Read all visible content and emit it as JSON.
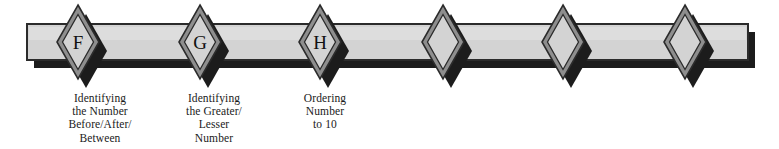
{
  "canvas": {
    "width": 779,
    "height": 149,
    "background": "#ffffff"
  },
  "colors": {
    "bar_fill": "#d3d3d3",
    "bar_fill_light": "#dcdcdc",
    "bar_outline": "#2b2b2b",
    "shadow": "#1c1c1c",
    "diamond_outer": "#8e8e8e",
    "diamond_inner": "#d3d3d3",
    "diamond_outline": "#2b2b2b",
    "text": "#1a1a1a"
  },
  "bar": {
    "name": "horizontal-progression-bar",
    "x": 27,
    "y": 24,
    "width": 721,
    "height": 36,
    "shadow_offset_x": 7,
    "shadow_offset_y": 8
  },
  "diamonds": [
    {
      "id": "diamond-f",
      "letter": "F",
      "cx": 78,
      "cy": 42,
      "rx": 21,
      "ry": 37
    },
    {
      "id": "diamond-g",
      "letter": "G",
      "cx": 200,
      "cy": 42,
      "rx": 21,
      "ry": 37
    },
    {
      "id": "diamond-h",
      "letter": "H",
      "cx": 320,
      "cy": 42,
      "rx": 21,
      "ry": 37
    },
    {
      "id": "diamond-4",
      "letter": "",
      "cx": 443,
      "cy": 42,
      "rx": 21,
      "ry": 37
    },
    {
      "id": "diamond-5",
      "letter": "",
      "cx": 563,
      "cy": 42,
      "rx": 21,
      "ry": 37
    },
    {
      "id": "diamond-6",
      "letter": "",
      "cx": 685,
      "cy": 42,
      "rx": 21,
      "ry": 37
    }
  ],
  "labels": [
    {
      "id": "label-f",
      "for": "diamond-f",
      "cx": 100,
      "top": 92,
      "width": 130,
      "text": "Identifying\nthe Number\nBefore/After/\nBetween",
      "lines": [
        "Identifying",
        "the Number",
        "Before/After/",
        "Between"
      ]
    },
    {
      "id": "label-g",
      "for": "diamond-g",
      "cx": 214,
      "top": 92,
      "width": 130,
      "text": "Identifying\nthe Greater/\nLesser\nNumber",
      "lines": [
        "Identifying",
        "the Greater/",
        "Lesser",
        "Number"
      ]
    },
    {
      "id": "label-h",
      "for": "diamond-h",
      "cx": 325,
      "top": 92,
      "width": 130,
      "text": "Ordering\nNumber\nto 10",
      "lines": [
        "Ordering",
        "Number",
        "to 10"
      ]
    }
  ]
}
